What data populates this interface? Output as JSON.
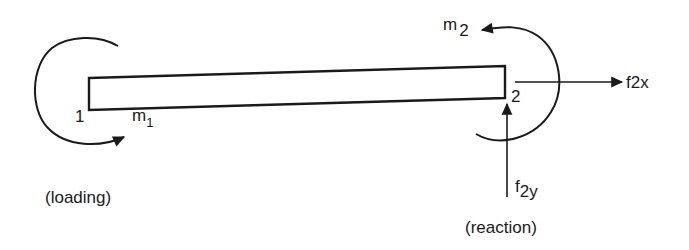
{
  "diagram": {
    "type": "beam free-body diagram",
    "beam": {
      "node_left_label": "1",
      "node_right_label": "2"
    },
    "moments": [
      {
        "id": "m1",
        "symbol": "m",
        "subscript": "1",
        "direction": "counterclockwise-arc ending at bottom, arrow pointing right",
        "at_node": "1"
      },
      {
        "id": "m2",
        "symbol": "m",
        "subscript": "2",
        "direction": "arc around node 2, arrow pointing left at top",
        "at_node": "2"
      }
    ],
    "forces": [
      {
        "id": "f2x",
        "symbol": "f",
        "subscript": "2x",
        "direction": "right",
        "at_node": "2"
      },
      {
        "id": "f2y",
        "symbol": "f",
        "subscript": "2y",
        "direction": "up",
        "at_node": "2"
      }
    ],
    "captions": {
      "left": "(loading)",
      "right": "(reaction)"
    },
    "colors": {
      "ink": "#1a1a1a",
      "background": "#ffffff"
    }
  }
}
